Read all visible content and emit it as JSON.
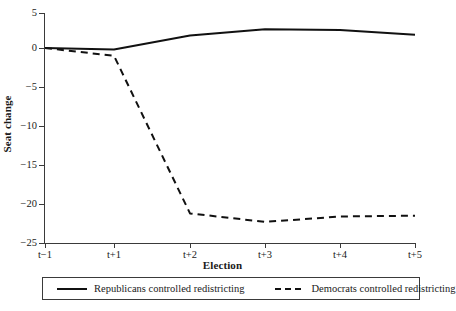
{
  "chart_data": {
    "type": "line",
    "title": "",
    "xlabel": "Election",
    "ylabel": "Seat change",
    "x": [
      "t-1",
      "t+1",
      "t+2",
      "t+3",
      "t+4",
      "t+5"
    ],
    "xtick_labels": [
      "t−1",
      "t+1",
      "t+2",
      "t+3",
      "t+4",
      "t+5"
    ],
    "ytick_labels": [
      "5",
      "0",
      "−5",
      "−10",
      "−15",
      "−20",
      "−25"
    ],
    "ytick_values": [
      5,
      0,
      -5,
      -10,
      -15,
      -20,
      -25
    ],
    "ylim": [
      -25,
      5
    ],
    "grid": false,
    "legend_position": "below-axes",
    "series": [
      {
        "name": "Republicans controlled redistricting",
        "style": "solid",
        "color": "#111111",
        "values": [
          0.0,
          -0.2,
          1.6,
          2.4,
          2.3,
          1.7
        ]
      },
      {
        "name": "Democrats controlled redistricting",
        "style": "dashed",
        "color": "#111111",
        "values": [
          0.0,
          -1.0,
          -21.2,
          -22.3,
          -21.6,
          -21.5
        ]
      }
    ]
  },
  "legend": {
    "republicans_label": "Republicans controlled redistricting",
    "democrats_label": "Democrats controlled redistricting"
  }
}
